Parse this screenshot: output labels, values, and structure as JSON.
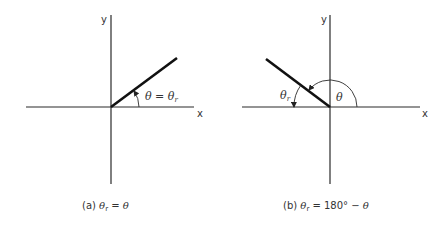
{
  "panels": [
    {
      "id": "a",
      "axis_labels": {
        "x": "x",
        "y": "y"
      },
      "angle_label": {
        "lhs": "θ",
        "eq": " = ",
        "rhs": "θ",
        "sub": "r"
      },
      "caption": {
        "prefix": "(a) ",
        "lhs": "θ",
        "sub": "r",
        "rest": " = ",
        "rhs": "θ"
      },
      "ray_angle_deg": 37
    },
    {
      "id": "b",
      "axis_labels": {
        "x": "x",
        "y": "y"
      },
      "theta_label": "θ",
      "theta_r_label": {
        "sym": "θ",
        "sub": "r"
      },
      "caption": {
        "prefix": "(b) ",
        "lhs": "θ",
        "sub": "r",
        "rest": " = 180° − ",
        "rhs": "θ"
      },
      "ray_angle_deg": 143
    }
  ]
}
